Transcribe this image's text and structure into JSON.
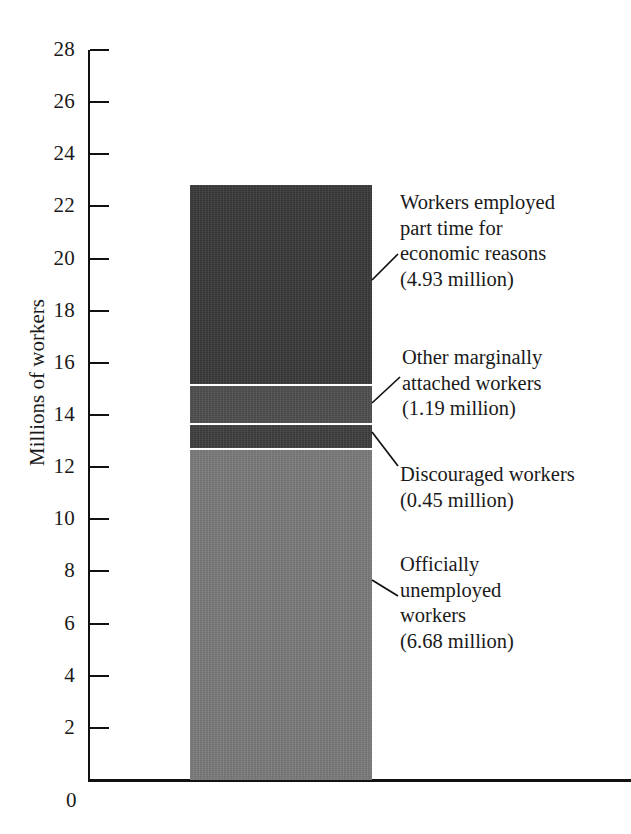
{
  "chart_data": {
    "type": "bar",
    "title": "",
    "subtitle": "",
    "xlabel": "",
    "ylabel": "Millions of workers",
    "ylim": [
      0,
      28
    ],
    "y_ticks": [
      28,
      26,
      24,
      22,
      20,
      18,
      16,
      14,
      12,
      10,
      8,
      6,
      4,
      2
    ],
    "y_tick_labels": [
      "28",
      "26",
      "24",
      "22",
      "20",
      "18",
      "16",
      "14",
      "12",
      "10",
      "8",
      "6",
      "4",
      "2"
    ],
    "x_origin_label": "0",
    "grid": false,
    "legend": "annotations-right",
    "categories": [
      "Underutilized labor"
    ],
    "stacked": true,
    "bar_total_drawn": 22.6,
    "series": [
      {
        "name": "Officially unemployed workers",
        "value": 6.68,
        "value_label": "(6.68 million)",
        "drawn_extent": [
          0,
          12.65
        ],
        "color": "#7b7b7b"
      },
      {
        "name": "Discouraged workers",
        "value": 0.45,
        "value_label": "(0.45 million)",
        "drawn_extent": [
          12.65,
          13.55
        ],
        "color": "#3f3f3f"
      },
      {
        "name": "Other marginally attached workers",
        "value": 1.19,
        "value_label": "(1.19 million)",
        "drawn_extent": [
          13.55,
          14.95
        ],
        "color": "#4f4f4f"
      },
      {
        "name": "Workers employed part time for economic reasons",
        "value": 4.93,
        "value_label": "(4.93 million)",
        "drawn_extent": [
          14.95,
          22.6
        ],
        "color": "#3a3a3a"
      }
    ],
    "annotations": [
      {
        "id": "part-time-economic",
        "text": "Workers employed\npart time for\neconomic reasons\n(4.93 million)"
      },
      {
        "id": "other-marginally-attached",
        "text": "Other marginally\nattached workers\n(1.19 million)"
      },
      {
        "id": "discouraged",
        "text": "Discouraged workers\n(0.45 million)"
      },
      {
        "id": "officially-unemployed",
        "text": "Officially\nunemployed\nworkers\n(6.68 million)"
      }
    ]
  }
}
